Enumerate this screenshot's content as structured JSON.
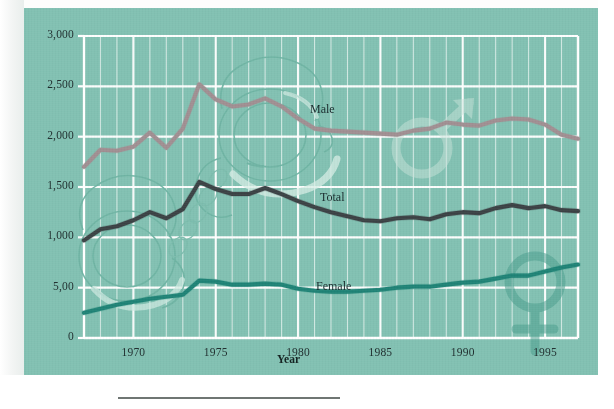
{
  "figure": {
    "background_color": "#82c1b2",
    "grid_color": "#ffffff",
    "axis_title_x": "Year",
    "series_labels": {
      "male": "Male",
      "total": "Total",
      "female": "Female"
    },
    "watermarks": [
      "handcuffs-watermark",
      "male-symbol-watermark",
      "female-symbol-watermark"
    ]
  },
  "chart_data": {
    "type": "line",
    "title": "",
    "xlabel": "Year",
    "ylabel": "",
    "xlim": [
      1967,
      1997
    ],
    "ylim": [
      0,
      3000
    ],
    "grid": true,
    "legend": "inline-labels",
    "y_ticks": [
      0,
      500,
      1000,
      1500,
      2000,
      2500,
      3000
    ],
    "y_tick_labels": [
      "0",
      "5,00",
      "1,000",
      "1,500",
      "2,000",
      "2,500",
      "3,000"
    ],
    "x_ticks": [
      1970,
      1975,
      1980,
      1985,
      1990,
      1995
    ],
    "x_tick_labels": [
      "1970",
      "1975",
      "1980",
      "1985",
      "1990",
      "1995"
    ],
    "x": [
      1967,
      1968,
      1969,
      1970,
      1971,
      1972,
      1973,
      1974,
      1975,
      1976,
      1977,
      1978,
      1979,
      1980,
      1981,
      1982,
      1983,
      1984,
      1985,
      1986,
      1987,
      1988,
      1989,
      1990,
      1991,
      1992,
      1993,
      1994,
      1995,
      1996,
      1997
    ],
    "series": [
      {
        "name": "Male",
        "color": "#a08f92",
        "values": [
          1700,
          1870,
          1860,
          1900,
          2040,
          1890,
          2080,
          2520,
          2370,
          2300,
          2320,
          2380,
          2300,
          2180,
          2080,
          2060,
          2050,
          2040,
          2030,
          2020,
          2060,
          2080,
          2140,
          2120,
          2110,
          2160,
          2180,
          2170,
          2120,
          2020,
          1980
        ]
      },
      {
        "name": "Total",
        "color": "#3b4245",
        "values": [
          970,
          1080,
          1110,
          1170,
          1250,
          1190,
          1280,
          1550,
          1480,
          1430,
          1430,
          1490,
          1430,
          1360,
          1300,
          1250,
          1210,
          1170,
          1160,
          1190,
          1200,
          1180,
          1230,
          1250,
          1240,
          1290,
          1320,
          1290,
          1310,
          1270,
          1260
        ]
      },
      {
        "name": "Female",
        "color": "#1f8376",
        "values": [
          250,
          290,
          330,
          360,
          390,
          410,
          430,
          570,
          560,
          530,
          530,
          540,
          530,
          490,
          470,
          460,
          460,
          470,
          480,
          500,
          510,
          510,
          530,
          550,
          560,
          590,
          620,
          620,
          660,
          700,
          730
        ]
      }
    ]
  }
}
